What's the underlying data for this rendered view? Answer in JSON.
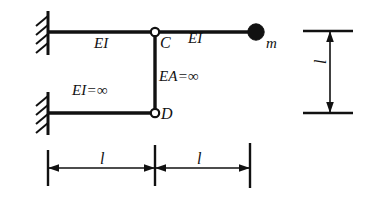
{
  "figure": {
    "stroke_color": "#111111",
    "background_color": "#ffffff"
  },
  "members": {
    "top_beam_left_label": "EI",
    "top_beam_right_label": "EI",
    "vertical_link_label": "EA=∞",
    "bottom_beam_label": "EI=∞"
  },
  "joints": {
    "hinge_c_label": "C",
    "hinge_d_label": "D"
  },
  "mass": {
    "label": "m"
  },
  "dimensions": {
    "horizontal_left_label": "l",
    "horizontal_right_label": "l",
    "vertical_label": "l"
  },
  "supports": {
    "top_support_name": "fixed-support",
    "bottom_support_name": "fixed-support"
  }
}
